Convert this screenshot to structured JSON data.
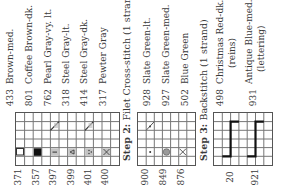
{
  "step1": {
    "legend": [
      {
        "number": "433",
        "name": "Brown-med."
      },
      {
        "number": "801",
        "name": "Coffee Brown-dk."
      },
      {
        "number": "762",
        "name": "Pearl Gray-vy. lt."
      },
      {
        "number": "318",
        "name": "Steel Gray-lt."
      },
      {
        "number": "414",
        "name": "Steel Gray-dk."
      },
      {
        "number": "317",
        "name": "Pewter Gray"
      }
    ],
    "grid_labels": [
      "371",
      "357",
      "397",
      "399",
      "401",
      "400"
    ]
  },
  "step2": {
    "title_bold": "Step 2:",
    "title_rest": " Filet Cross-stitch (1 strand)",
    "legend": [
      {
        "number": "928",
        "name": "Slate Green-lt."
      },
      {
        "number": "927",
        "name": "Slate Green-med."
      },
      {
        "number": "502",
        "name": "Blue Green"
      }
    ],
    "grid_labels": [
      "900",
      "849",
      "876"
    ]
  },
  "step3": {
    "title_bold": "Step 3:",
    "title_rest": " Backstitch (1 strand)",
    "legend": [
      {
        "number": "498",
        "name_line1": "Christmas Red-dk.",
        "name_line2": "(reins)"
      },
      {
        "number": "931",
        "name_line1": "Antique Blue-med.",
        "name_line2": "(lettering)"
      }
    ],
    "grid_labels": [
      "20",
      "921"
    ]
  },
  "colors": {
    "grid_line": "#666666",
    "fill_dark": "#111111",
    "fill_gray": "#b8b8b8",
    "backstitch": "#111111"
  }
}
